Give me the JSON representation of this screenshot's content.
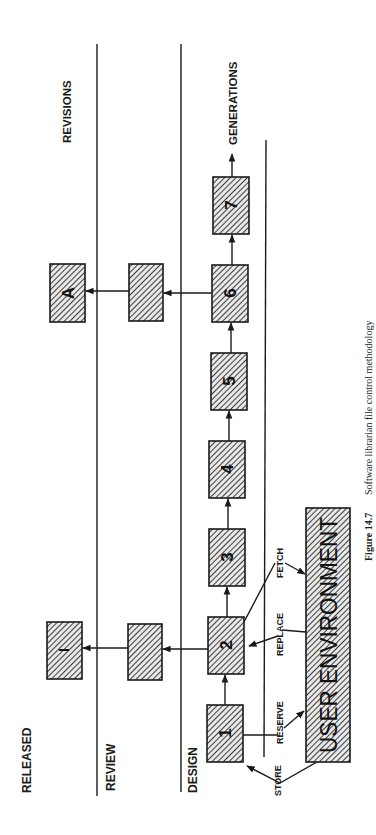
{
  "diagram": {
    "orientation": "rotated-90-ccw",
    "lanes": {
      "released": "RELEASED",
      "review": "REVIEW",
      "design": "DESIGN"
    },
    "axis_labels": {
      "revisions": "REVISIONS",
      "generations": "GENERATIONS"
    },
    "boxes": {
      "g1": "1",
      "g2": "2",
      "g3": "3",
      "g4": "4",
      "g5": "5",
      "g6": "6",
      "g7": "7",
      "review_from_2": "",
      "review_from_6": "",
      "released_I": "I",
      "released_A": "A"
    },
    "user_environment": "USER ENVIRONMENT",
    "operations": {
      "store": "STORE",
      "reserve": "RESERVE",
      "replace": "REPLACE",
      "fetch": "FETCH"
    }
  },
  "caption": {
    "figure_number": "Figure 14.7",
    "text": "Software librarian file control methodology"
  }
}
